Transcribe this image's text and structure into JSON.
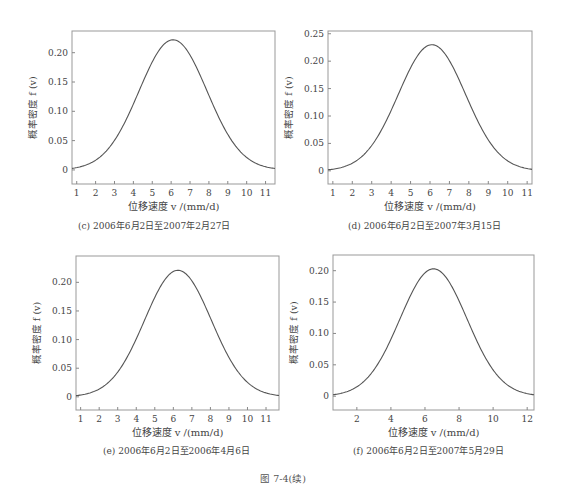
{
  "figure_caption": "图 7-4(续)",
  "chart_data": [
    {
      "id": "c",
      "type": "line",
      "title": "",
      "caption": "(c)  2006年6月2日至2007年2月27日",
      "xlabel": "位移速度 v /(mm/d)",
      "ylabel": "概率密度 f (v)",
      "xlim": [
        0.75,
        11.5
      ],
      "ylim": [
        -0.024,
        0.237
      ],
      "xticks": [
        1,
        2,
        3,
        4,
        5,
        6,
        7,
        8,
        9,
        10,
        11
      ],
      "yticks": [
        0,
        0.05,
        0.1,
        0.15,
        0.2
      ],
      "ytick_labels": [
        "0",
        "0.05",
        "0.10",
        "0.15",
        "0.20"
      ],
      "grid": false,
      "series": [
        {
          "name": "f(v)",
          "distribution": "normal",
          "mean": 6.1,
          "sigma": 1.8,
          "peak": 0.222
        }
      ],
      "box": {
        "left": 72,
        "top": 31,
        "right": 275,
        "bottom": 184
      },
      "caption_pos": {
        "left": 78,
        "top": 219
      }
    },
    {
      "id": "d",
      "type": "line",
      "title": "",
      "caption": "(d)  2006年6月2日至2007年3月15日",
      "xlabel": "位移速度 v /(mm/d)",
      "ylabel": "概率密度 f (v)",
      "xlim": [
        0.75,
        11.25
      ],
      "ylim": [
        -0.024,
        0.255
      ],
      "xticks": [
        1,
        2,
        3,
        4,
        5,
        6,
        7,
        8,
        9,
        10,
        11
      ],
      "yticks": [
        0,
        0.05,
        0.1,
        0.15,
        0.2,
        0.25
      ],
      "ytick_labels": [
        "0",
        "0.05",
        "0.10",
        "0.15",
        "0.20",
        "0.25"
      ],
      "grid": false,
      "series": [
        {
          "name": "f(v)",
          "distribution": "normal",
          "mean": 6.1,
          "sigma": 1.73,
          "peak": 0.23
        }
      ],
      "box": {
        "left": 328,
        "top": 31,
        "right": 532,
        "bottom": 184
      },
      "caption_pos": {
        "left": 348,
        "top": 219
      }
    },
    {
      "id": "e",
      "type": "line",
      "title": "",
      "caption": "(e)  2006年6月2日至2006年4月6日",
      "xlabel": "位移速度 v /(mm/d)",
      "ylabel": "概率密度 f (v)",
      "xlim": [
        0.75,
        11.7
      ],
      "ylim": [
        -0.023,
        0.246
      ],
      "xticks": [
        1,
        2,
        3,
        4,
        5,
        6,
        7,
        8,
        9,
        10,
        11
      ],
      "yticks": [
        0,
        0.05,
        0.1,
        0.15,
        0.2
      ],
      "ytick_labels": [
        "0",
        "0.05",
        "0.10",
        "0.15",
        "0.20"
      ],
      "grid": false,
      "series": [
        {
          "name": "f(v)",
          "distribution": "normal",
          "mean": 6.25,
          "sigma": 1.8,
          "peak": 0.221
        }
      ],
      "box": {
        "left": 76,
        "top": 256,
        "right": 279,
        "bottom": 410
      },
      "caption_pos": {
        "left": 103,
        "top": 444
      }
    },
    {
      "id": "f",
      "type": "line",
      "title": "",
      "caption": "(f)  2006年6月2日至2007年5月29日",
      "xlabel": "位移速度 v /(mm/d)",
      "ylabel": "概率密度 f (v)",
      "xlim": [
        0.6,
        12.4
      ],
      "ylim": [
        -0.022,
        0.225
      ],
      "xticks": [
        2,
        4,
        6,
        8,
        10,
        12
      ],
      "yticks": [
        0,
        0.05,
        0.1,
        0.15,
        0.2
      ],
      "ytick_labels": [
        "0",
        "0.05",
        "0.10",
        "0.15",
        "0.20"
      ],
      "grid": false,
      "series": [
        {
          "name": "f(v)",
          "distribution": "normal",
          "mean": 6.5,
          "sigma": 1.97,
          "peak": 0.203
        }
      ],
      "box": {
        "left": 333,
        "top": 255,
        "right": 534,
        "bottom": 410
      },
      "caption_pos": {
        "left": 353,
        "top": 444
      }
    }
  ]
}
